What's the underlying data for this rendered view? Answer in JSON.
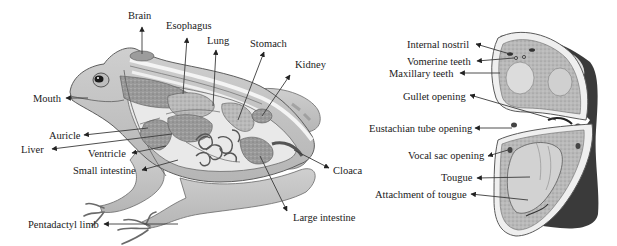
{
  "figure": {
    "left_panel": {
      "subject": "frog-internal-anatomy-side-view",
      "labels": [
        {
          "id": "brain",
          "text": "Brain"
        },
        {
          "id": "esophagus",
          "text": "Esophagus"
        },
        {
          "id": "lung",
          "text": "Lung"
        },
        {
          "id": "stomach",
          "text": "Stomach"
        },
        {
          "id": "kidney",
          "text": "Kidney"
        },
        {
          "id": "mouth",
          "text": "Mouth"
        },
        {
          "id": "auricle",
          "text": "Auricle"
        },
        {
          "id": "liver",
          "text": "Liver"
        },
        {
          "id": "ventricle",
          "text": "Ventricle"
        },
        {
          "id": "small-intestine",
          "text": "Small intestine"
        },
        {
          "id": "cloaca",
          "text": "Cloaca"
        },
        {
          "id": "large-intestine",
          "text": "Large intestine"
        },
        {
          "id": "pentadactyl-limb",
          "text": "Pentadactyl limb"
        }
      ]
    },
    "right_panel": {
      "subject": "frog-buccal-cavity-open-mouth",
      "labels": [
        {
          "id": "internal-nostril",
          "text": "Internal nostril"
        },
        {
          "id": "vomerine-teeth",
          "text": "Vomerine teeth"
        },
        {
          "id": "maxillary-teeth",
          "text": "Maxillary teeth"
        },
        {
          "id": "gullet-opening",
          "text": "Gullet opening"
        },
        {
          "id": "eustachian-tube-opening",
          "text": "Eustachian tube opening"
        },
        {
          "id": "vocal-sac-opening",
          "text": "Vocal sac opening"
        },
        {
          "id": "tougue",
          "text": "Tougue"
        },
        {
          "id": "attachment-of-tougue",
          "text": "Attachment of tougue"
        }
      ]
    }
  }
}
